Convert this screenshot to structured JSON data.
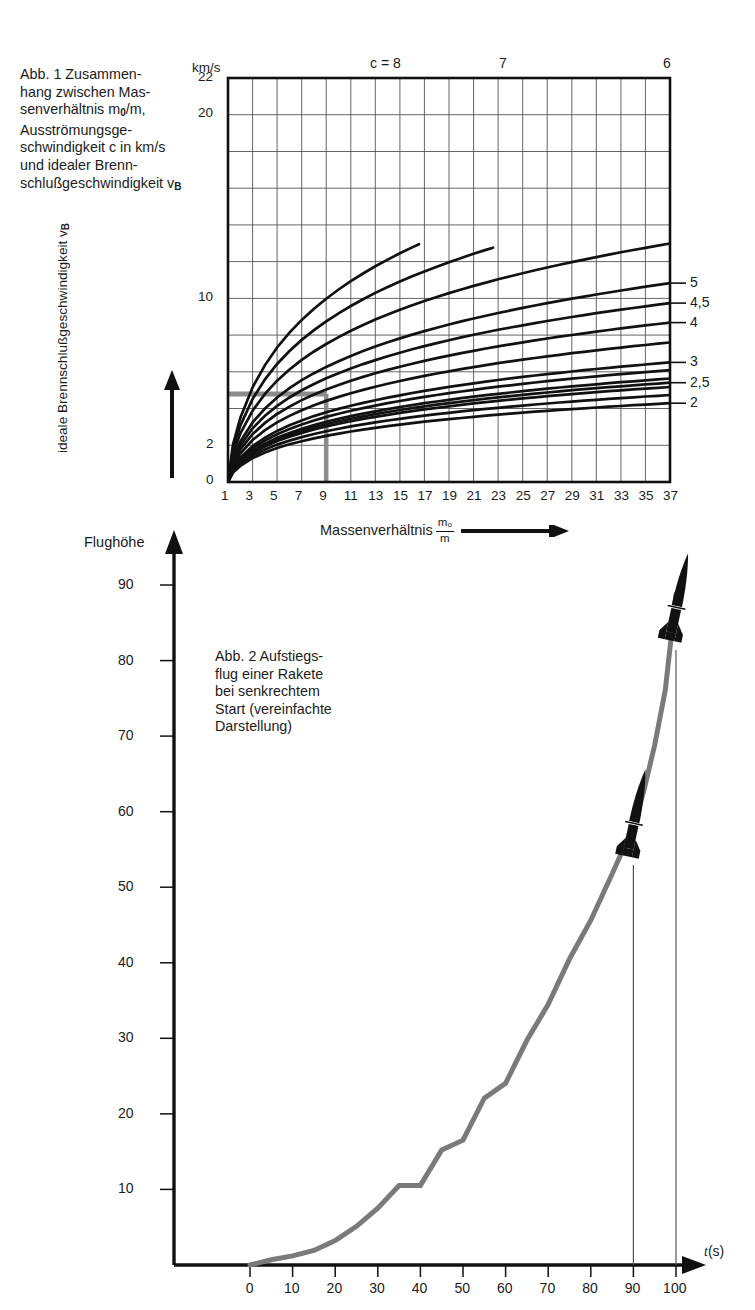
{
  "figure1": {
    "caption": "Abb. 1  Zusammenhang zwischen Massenverhältnis m0/m, Ausströmungsgeschwindigkeit c in km/s und idealer Brennschlußgeschwindigkeit vB",
    "caption_lines": [
      "Abb. 1  Zusammen-",
      "hang zwischen Mas-",
      "senverhältnis  m",
      "/m,",
      "Ausströmungsge-",
      "schwindigkeit c in km/s",
      "und idealer Brenn-",
      "schlußgeschwindigkeit v"
    ],
    "y_unit": "km/s",
    "y_axis_label": "ideale Brennschlußgeschwindigkeit v",
    "y_axis_label_sub": "B",
    "x_axis_label": "Massenverhältnis",
    "x_axis_fraction_num": "m",
    "x_axis_fraction_num_sub": "o",
    "x_axis_fraction_den": "m",
    "top_label_prefix": "c = ",
    "top_labels": [
      "8",
      "7",
      "6"
    ],
    "right_labels": [
      "5",
      "4,5",
      "4",
      "3",
      "2,5",
      "2"
    ],
    "y_ticks": [
      "0",
      "2",
      "10",
      "20",
      "22"
    ],
    "x_ticks": [
      "1",
      "3",
      "5",
      "7",
      "9",
      "11",
      "13",
      "15",
      "17",
      "19",
      "21",
      "23",
      "25",
      "27",
      "29",
      "31",
      "33",
      "35",
      "37"
    ]
  },
  "figure2": {
    "caption_lines": [
      "Abb. 2  Aufstiegs-",
      "flug einer Rakete",
      "bei senkrechtem",
      "Start (vereinfachte",
      "Darstellung)"
    ],
    "y_axis_label": "Flughöhe",
    "x_axis_label_var": "t",
    "x_axis_label_unit": "(s)",
    "y_ticks": [
      "90",
      "80",
      "70",
      "60",
      "50",
      "40",
      "30",
      "20",
      "10"
    ],
    "x_ticks": [
      "0",
      "10",
      "20",
      "30",
      "40",
      "50",
      "60",
      "70",
      "80",
      "90",
      "100"
    ]
  },
  "colors": {
    "ink": "#111111",
    "grid": "#555555",
    "highlight": "#8c8c8c",
    "curve": "#7a7a7a"
  },
  "chart_data": [
    {
      "type": "line",
      "title": "Abb. 1 — ideale Brennschlußgeschwindigkeit vs Massenverhältnis",
      "xlabel": "Massenverhältnis m0/m",
      "ylabel": "ideale Brennschlußgeschwindigkeit vB (km/s)",
      "xlim": [
        1,
        37
      ],
      "ylim": [
        0,
        22
      ],
      "grid": true,
      "x_tick_step": 2,
      "y_tick_step": 2,
      "y_labeled_ticks": [
        0,
        2,
        10,
        20,
        22
      ],
      "formula": "vB = c * ln(m0/m)",
      "legend_position": "right-and-top",
      "series": [
        {
          "name": "c = 8",
          "c": 8.0,
          "label_position": "top",
          "label": "c = 8"
        },
        {
          "name": "c = 7",
          "c": 7.0,
          "label_position": "top",
          "label": "7"
        },
        {
          "name": "c = 6",
          "c": 6.0,
          "label_position": "top",
          "label": "6"
        },
        {
          "name": "c = 5",
          "c": 5.0,
          "label_position": "right",
          "label": "5"
        },
        {
          "name": "c = 4,5",
          "c": 4.5,
          "label_position": "right",
          "label": "4,5"
        },
        {
          "name": "c = 4",
          "c": 4.0,
          "label_position": "right",
          "label": "4"
        },
        {
          "name": "c = 3,5",
          "c": 3.5,
          "label_position": "none",
          "label": ""
        },
        {
          "name": "c = 3",
          "c": 3.0,
          "label_position": "right",
          "label": "3"
        },
        {
          "name": "c = 2,8",
          "c": 2.8,
          "label_position": "none",
          "label": ""
        },
        {
          "name": "c = 2,6",
          "c": 2.6,
          "label_position": "none",
          "label": ""
        },
        {
          "name": "c = 2,5",
          "c": 2.5,
          "label_position": "right",
          "label": "2,5"
        },
        {
          "name": "c = 2,4",
          "c": 2.4,
          "label_position": "none",
          "label": ""
        },
        {
          "name": "c = 2,2",
          "c": 2.2,
          "label_position": "none",
          "label": ""
        },
        {
          "name": "c = 2",
          "c": 2.0,
          "label_position": "right",
          "label": "2"
        }
      ],
      "annotations": [
        {
          "type": "reference-line",
          "orientation": "vertical",
          "x": 9,
          "color": "#8c8c8c"
        },
        {
          "type": "reference-line",
          "orientation": "horizontal",
          "y": 4.8,
          "x_from": 1,
          "x_to": 9,
          "color": "#8c8c8c"
        }
      ]
    },
    {
      "type": "line",
      "title": "Abb. 2 — Aufstiegsflug einer Rakete bei senkrechtem Start",
      "xlabel": "t (s)",
      "ylabel": "Flughöhe",
      "xlim": [
        0,
        100
      ],
      "ylim": [
        0,
        90
      ],
      "grid": false,
      "x_tick_step": 10,
      "y_tick_step": 10,
      "series": [
        {
          "name": "Flugbahn",
          "color": "#7a7a7a",
          "x": [
            0,
            10,
            20,
            30,
            40,
            50,
            60,
            70,
            80,
            90,
            100
          ],
          "y": [
            0,
            1.2,
            3.2,
            6.2,
            10.5,
            16.5,
            24.5,
            34.5,
            45.5,
            58.0,
            86.5
          ]
        }
      ],
      "annotations": [
        {
          "type": "rocket-marker",
          "x": 90,
          "y": 58.0,
          "drop_line": true
        },
        {
          "type": "rocket-marker",
          "x": 100,
          "y": 86.5,
          "drop_line": true
        }
      ]
    }
  ]
}
